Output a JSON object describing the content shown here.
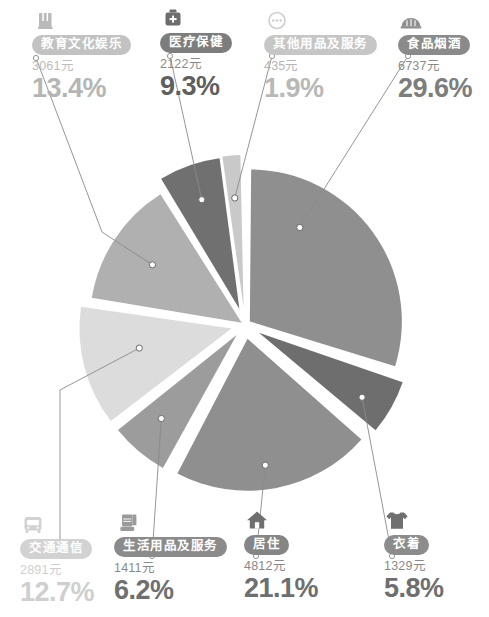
{
  "chart_data": {
    "type": "pie",
    "title": "",
    "unit": "元",
    "legend_position": "around",
    "grid": false,
    "categories": [
      "其他用品及服务",
      "食品烟酒",
      "衣着",
      "居住",
      "生活用品及服务",
      "交通通信",
      "教育文化娱乐",
      "医疗保健"
    ],
    "values": [
      1.9,
      29.6,
      5.8,
      21.1,
      6.2,
      12.7,
      13.4,
      9.3
    ],
    "amounts": [
      435,
      6737,
      1329,
      4812,
      1411,
      2891,
      3061,
      2122
    ],
    "slices": [
      {
        "name": "其他用品及服务",
        "amount": "435元",
        "percent": "1.9%",
        "value": 1.9,
        "color": "#c9c9c9",
        "icon": "ellipsis-circle-icon",
        "pill_color": "#c6c6c6",
        "text_color": "#b5b5b5",
        "pct_color": "#b8b8b8",
        "start_deg": -8.0,
        "end_deg": -1.2,
        "explode": 18,
        "dot_deg": -4.6,
        "dot_r": 0.72
      },
      {
        "name": "食品烟酒",
        "amount": "6737元",
        "percent": "29.6%",
        "value": 29.6,
        "color": "#8f8f8f",
        "icon": "bread-icon",
        "pill_color": "#8a8a8a",
        "text_color": "#8a8a8a",
        "pct_color": "#7d7d7d",
        "start_deg": 0.5,
        "end_deg": 107.1,
        "explode": 6,
        "dot_deg": 28.0,
        "dot_r": 0.7
      },
      {
        "name": "衣着",
        "amount": "1329元",
        "percent": "5.8%",
        "value": 5.8,
        "color": "#6e6e6e",
        "icon": "tshirt-icon",
        "pill_color": "#8c8c8c",
        "text_color": "#8a8a8a",
        "pct_color": "#6e6e6e",
        "start_deg": 109.0,
        "end_deg": 129.9,
        "explode": 16,
        "dot_deg": 122.0,
        "dot_r": 0.8
      },
      {
        "name": "居住",
        "amount": "4812元",
        "percent": "21.1%",
        "value": 21.1,
        "color": "#8f8f8f",
        "icon": "house-icon",
        "pill_color": "#858585",
        "text_color": "#888888",
        "pct_color": "#6e6e6e",
        "start_deg": 131.5,
        "end_deg": 207.5,
        "explode": 14,
        "dot_deg": 172.0,
        "dot_r": 0.84
      },
      {
        "name": "生活用品及服务",
        "amount": "1411元",
        "percent": "6.2%",
        "value": 6.2,
        "color": "#9c9c9c",
        "icon": "towel-icon",
        "pill_color": "#8b8b8b",
        "text_color": "#8a8a8a",
        "pct_color": "#6f6f6f",
        "start_deg": 209.0,
        "end_deg": 231.3,
        "explode": 13,
        "dot_deg": 222.0,
        "dot_r": 0.74
      },
      {
        "name": "交通通信",
        "amount": "2891元",
        "percent": "12.7%",
        "value": 12.7,
        "color": "#dcdcdc",
        "icon": "bus-icon",
        "pill_color": "#d2d2d2",
        "text_color": "#cfcfcf",
        "pct_color": "#cfcfcf",
        "start_deg": 232.5,
        "end_deg": 278.2,
        "explode": 14,
        "dot_deg": 258.0,
        "dot_r": 0.62
      },
      {
        "name": "教育文化娱乐",
        "amount": "3061元",
        "percent": "13.4%",
        "value": 13.4,
        "color": "#b0b0b0",
        "icon": "book-icon",
        "pill_color": "#c2c2c2",
        "text_color": "#bdbdbd",
        "pct_color": "#b5b5b5",
        "start_deg": 279.5,
        "end_deg": 327.7,
        "explode": 4,
        "dot_deg": 303.0,
        "dot_r": 0.7
      },
      {
        "name": "医疗保健",
        "amount": "2122元",
        "percent": "9.3%",
        "value": 9.3,
        "color": "#707070",
        "icon": "medkit-icon",
        "pill_color": "#7d7d7d",
        "text_color": "#8a8a8a",
        "pct_color": "#5f5f5f",
        "start_deg": 329.0,
        "end_deg": 352.5,
        "explode": 17,
        "dot_deg": 341.0,
        "dot_r": 0.76
      }
    ]
  },
  "labels": {
    "edu": {
      "title": "教育文化娱乐",
      "amount": "3061元",
      "percent": "13.4%"
    },
    "med": {
      "title": "医疗保健",
      "amount": "2122元",
      "percent": "9.3%"
    },
    "other": {
      "title": "其他用品及服务",
      "amount": "435元",
      "percent": "1.9%"
    },
    "food": {
      "title": "食品烟酒",
      "amount": "6737元",
      "percent": "29.6%"
    },
    "trans": {
      "title": "交通通信",
      "amount": "2891元",
      "percent": "12.7%"
    },
    "daily": {
      "title": "生活用品及服务",
      "amount": "1411元",
      "percent": "6.2%"
    },
    "house": {
      "title": "居住",
      "amount": "4812元",
      "percent": "21.1%"
    },
    "cloth": {
      "title": "衣着",
      "amount": "1329元",
      "percent": "5.8%"
    }
  }
}
